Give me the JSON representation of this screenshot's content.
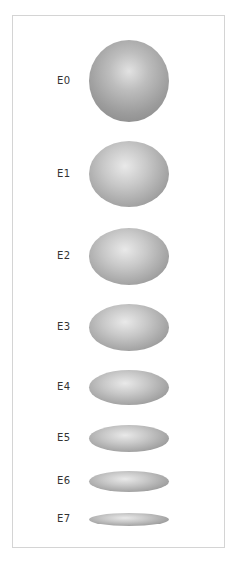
{
  "figure": {
    "frame_color": "#d4d4d4",
    "shape_color": "#a3a3a3",
    "items": [
      {
        "label": "E0",
        "shape": "sphere",
        "width": 80,
        "height": 82,
        "center_y": 81
      },
      {
        "label": "E1",
        "shape": "ellipse",
        "width": 80,
        "height": 66,
        "center_y": 174
      },
      {
        "label": "E2",
        "shape": "ellipse",
        "width": 80,
        "height": 57,
        "center_y": 256
      },
      {
        "label": "E3",
        "shape": "ellipse",
        "width": 80,
        "height": 47,
        "center_y": 327
      },
      {
        "label": "E4",
        "shape": "ellipse",
        "width": 80,
        "height": 35,
        "center_y": 387
      },
      {
        "label": "E5",
        "shape": "ellipse",
        "width": 80,
        "height": 27,
        "center_y": 438
      },
      {
        "label": "E6",
        "shape": "ellipse",
        "width": 80,
        "height": 21,
        "center_y": 481
      },
      {
        "label": "E7",
        "shape": "ellipse",
        "width": 80,
        "height": 13,
        "center_y": 519
      }
    ]
  }
}
